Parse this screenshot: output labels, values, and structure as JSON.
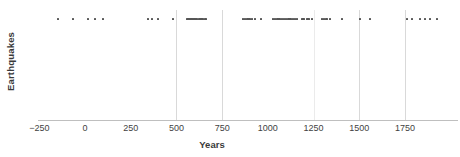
{
  "chart_data": {
    "type": "scatter",
    "title": "",
    "xlabel": "Years",
    "ylabel": "Earthquakes",
    "xlim": [
      -320,
      1990
    ],
    "ylim": [
      0,
      1
    ],
    "grid": true,
    "grid_axis": "x",
    "legend": "none",
    "marker": "small-square",
    "marker_color": "#555555",
    "series_note": "All events plotted on one horizontal strip near the top of the axes (y constant).",
    "xticks": [
      -250,
      0,
      250,
      500,
      750,
      1000,
      1250,
      1500,
      1750
    ],
    "xticklabels": [
      "−250",
      "0",
      "250",
      "500",
      "750",
      "1000",
      "1250",
      "1500",
      "1750"
    ],
    "gridline_years": [
      500,
      750,
      1250,
      1500,
      1750
    ],
    "x": [
      -148,
      -66,
      16,
      55,
      98,
      344,
      366,
      399,
      481,
      558,
      566,
      574,
      582,
      590,
      598,
      606,
      614,
      622,
      630,
      638,
      646,
      656,
      661,
      864,
      876,
      888,
      900,
      912,
      929,
      962,
      1028,
      1040,
      1052,
      1064,
      1076,
      1088,
      1100,
      1112,
      1124,
      1136,
      1148,
      1159,
      1186,
      1195,
      1214,
      1223,
      1241,
      1296,
      1308,
      1320,
      1340,
      1405,
      1504,
      1559,
      1761,
      1788,
      1832,
      1859,
      1887,
      1925
    ],
    "y_constant": 0.93,
    "n_points": 60
  },
  "axes": {
    "y_title": "Earthquakes",
    "x_title": "Years"
  }
}
